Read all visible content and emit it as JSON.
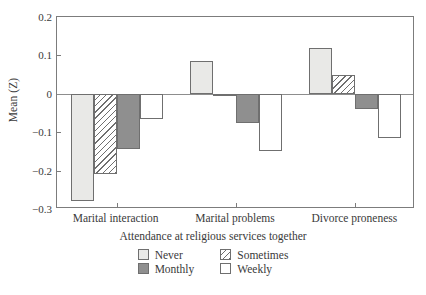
{
  "chart_data": {
    "type": "bar",
    "title": "",
    "xlabel": "",
    "ylabel": "Mean (Z)",
    "ylim": [
      -0.3,
      0.2
    ],
    "yticks": [
      0.2,
      0.1,
      0,
      -0.1,
      -0.2,
      -0.3
    ],
    "ytick_labels": [
      "0.2",
      "0.1",
      "0",
      "−0.1",
      "−0.2",
      "−0.3"
    ],
    "grid": false,
    "zero_line": true,
    "legend_position": "bottom",
    "legend_title": "Attendance at religious services together",
    "categories": [
      "Marital interaction",
      "Marital problems",
      "Divorce proneness"
    ],
    "series": [
      {
        "name": "Never",
        "values": [
          -0.28,
          0.085,
          0.12
        ],
        "color": "#e9e9e7",
        "pattern": "solid"
      },
      {
        "name": "Sometimes",
        "values": [
          -0.21,
          -0.005,
          0.05
        ],
        "color": "#ffffff",
        "pattern": "hatch"
      },
      {
        "name": "Monthly",
        "values": [
          -0.145,
          -0.075,
          -0.04
        ],
        "color": "#8f8f8f",
        "pattern": "solid"
      },
      {
        "name": "Weekly",
        "values": [
          -0.065,
          -0.15,
          -0.115
        ],
        "color": "#ffffff",
        "pattern": "solid"
      }
    ]
  },
  "axis": {
    "ylabel": "Mean (Z)"
  },
  "legend": {
    "title": "Attendance at religious services together",
    "items": [
      {
        "label": "Never"
      },
      {
        "label": "Sometimes"
      },
      {
        "label": "Monthly"
      },
      {
        "label": "Weekly"
      }
    ]
  }
}
